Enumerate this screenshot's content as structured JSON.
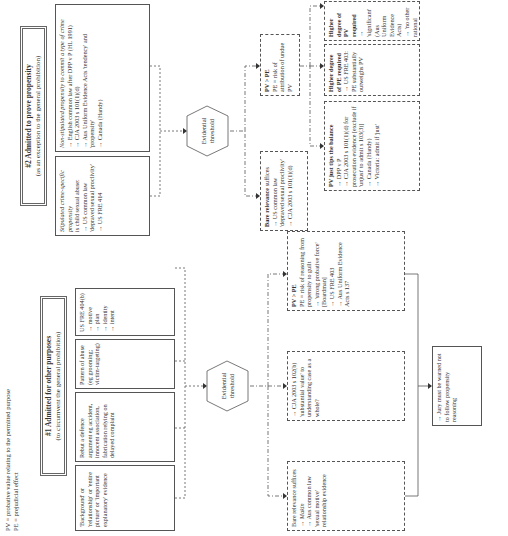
{
  "legend": {
    "pv": "PV = probative value relating to the permitted purpose",
    "pe": "PE = prejudicial effect"
  },
  "branch1": {
    "title": "#1 Admitted for other purposes",
    "subtitle": "(to circumvent the general prohibition)",
    "boxes": [
      {
        "text": "'Background' or 'relationship' or 'entire picture' or 'important explanatory' evidence"
      },
      {
        "text": "Rebut a defence argument eg accident, innocent association, fabrication relying on delayed complaint"
      },
      {
        "text": "Pattern of abuse (eg grooming; victim-targeting)"
      },
      {
        "lines": [
          "US FRE 404(b)",
          "→ motive",
          "→ plan",
          "→ identity",
          "→ intent"
        ]
      }
    ],
    "threshold": "Evidential threshold",
    "outcomes": [
      {
        "lines": [
          "Bare relevance suffices",
          "→ Makin",
          "→ Aus common law 'sexual motive' relationship evidence"
        ]
      },
      {
        "lines": [
          "→ CJA 2003 s 102(b) 'substantial value' to understanding case as a whole?"
        ]
      },
      {
        "title": "PV > PE",
        "lines": [
          "PE = risk of reasoning from propensity to guilt",
          "→ 'strong probative force' [Boardman]",
          "→ US FRE 403",
          "→ Aus Uniform Evidence Acts s 137"
        ]
      }
    ],
    "jury": "→ Jury must be warned not to follow propensity reasoning"
  },
  "branch2": {
    "title": "#2 Admitted to prove propensity",
    "subtitle": "(as an exception to the general prohibition)",
    "boxes": [
      {
        "italic": "Stipulated crime-specific propensity",
        "lines": [
          "is child sexual abuse:",
          "→ US common law 'depraved sexual proclivity'",
          "→ US FRE 414"
        ]
      },
      {
        "italic": "Non-stipulated propensity to commit a type of crime",
        "lines": [
          "→ English common law after DPP v P (HL 1991)",
          "→ CJA 2003 s 101(1)(d)",
          "→ Aus Uniform Evidence Acts 'tendency' and 'propensity'",
          "→ Canada (Handy)"
        ]
      }
    ],
    "threshold": "Evidential threshold",
    "outcomes": [
      {
        "title": "Bare relevance",
        "lines": [
          "suffices",
          "→ US common law 'depraved sexual proclivity'",
          "→ CJA 2003 s 101(1)(d)"
        ]
      },
      {
        "title": "PV > PE",
        "lines": [
          "PE = risk of attribution of undue PV"
        ]
      }
    ],
    "sub_outcomes": [
      {
        "title": "PV just tips the balance",
        "lines": [
          "→ DPP v P",
          "→ CJA 2003 s 101(1)(d) for prosecution evidence [exclude if 'unjust' to admit s 103(3)]",
          "→ Canada (Handy)",
          "→ Victoria: admit if 'just'"
        ]
      },
      {
        "title": "Higher degree of PE required",
        "lines": [
          "→ US FRE 403: PE substantially outweighs PV"
        ]
      },
      {
        "title": "Higher degree of PV required",
        "lines": [
          "→ 'significant' (Aus Uniform Evidence Acts)",
          "→ 'no other rational explanation' (Aus HC in Pfennig)",
          "→ CJA 2003 s 101(1)(e): 'substantial' PV if led by co-D"
        ]
      }
    ]
  }
}
